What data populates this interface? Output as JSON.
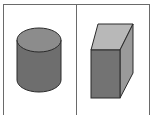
{
  "panels": [
    {
      "shape": "cylinder",
      "colors": {
        "top": "#8c8c8c",
        "side": "#6e6e6e",
        "outline": "#2a2a2a"
      }
    },
    {
      "shape": "rectangular-prism",
      "colors": {
        "top": "#b8b8b8",
        "front": "#737373",
        "side": "#9a9a9a",
        "outline": "#2a2a2a"
      }
    }
  ],
  "frame": {
    "color": "#6a6a6a"
  }
}
